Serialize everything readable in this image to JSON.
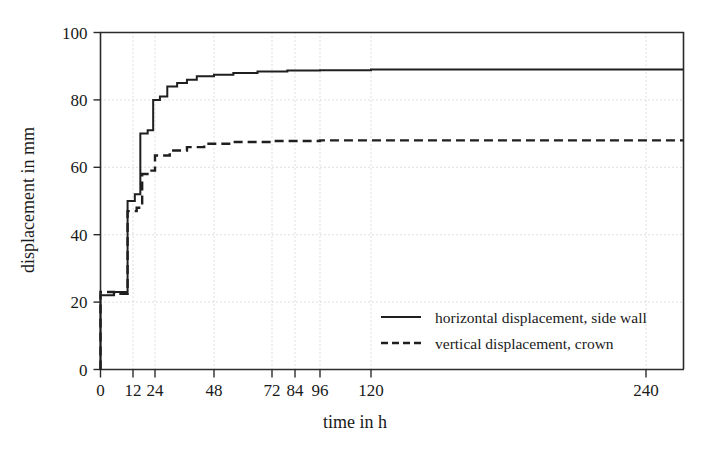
{
  "chart_data": {
    "type": "line",
    "title": "",
    "xlabel": "time in h",
    "ylabel": "displacement in mm",
    "xlim": [
      0,
      252
    ],
    "ylim": [
      0,
      100
    ],
    "grid": true,
    "legend_position": "inside-lower-right",
    "xticks": [
      0,
      12,
      24,
      48,
      72,
      84,
      96,
      120,
      240
    ],
    "xtick_labels": [
      "0",
      "12",
      "24",
      "48",
      "72",
      "84",
      "96",
      "120",
      "240"
    ],
    "yticks": [
      0,
      20,
      40,
      60,
      80,
      100
    ],
    "ytick_labels": [
      "0",
      "20",
      "40",
      "60",
      "80",
      "100"
    ],
    "series": [
      {
        "name": "horizontal displacement, side wall",
        "style": "solid",
        "points": [
          [
            0,
            0
          ],
          [
            0,
            22
          ],
          [
            5,
            22
          ],
          [
            5,
            23
          ],
          [
            10,
            23
          ],
          [
            10,
            50
          ],
          [
            13,
            50
          ],
          [
            13,
            52
          ],
          [
            16,
            52
          ],
          [
            16,
            70
          ],
          [
            20,
            70
          ],
          [
            20,
            71
          ],
          [
            23,
            71
          ],
          [
            23,
            80
          ],
          [
            26,
            80
          ],
          [
            26,
            81
          ],
          [
            29,
            81
          ],
          [
            29,
            84
          ],
          [
            33,
            84
          ],
          [
            33,
            85
          ],
          [
            37,
            85
          ],
          [
            37,
            86
          ],
          [
            41,
            86
          ],
          [
            41,
            87
          ],
          [
            48,
            87
          ],
          [
            48,
            87.5
          ],
          [
            56,
            87.5
          ],
          [
            56,
            88
          ],
          [
            66,
            88
          ],
          [
            66,
            88.4
          ],
          [
            80,
            88.4
          ],
          [
            80,
            88.7
          ],
          [
            96,
            88.7
          ],
          [
            96,
            88.8
          ],
          [
            120,
            88.8
          ],
          [
            120,
            89
          ],
          [
            240,
            89
          ],
          [
            252,
            89
          ]
        ]
      },
      {
        "name": "vertical displacement, crown",
        "style": "dashed",
        "points": [
          [
            0,
            0
          ],
          [
            0,
            23
          ],
          [
            5,
            23
          ],
          [
            5,
            22.5
          ],
          [
            10,
            22.5
          ],
          [
            10,
            47
          ],
          [
            14,
            47
          ],
          [
            14,
            48
          ],
          [
            17,
            48
          ],
          [
            17,
            58
          ],
          [
            21,
            58
          ],
          [
            21,
            59
          ],
          [
            24,
            59
          ],
          [
            24,
            63.5
          ],
          [
            30,
            63.5
          ],
          [
            30,
            65
          ],
          [
            37,
            65
          ],
          [
            37,
            66
          ],
          [
            44,
            66
          ],
          [
            44,
            67
          ],
          [
            56,
            67
          ],
          [
            56,
            67.5
          ],
          [
            72,
            67.5
          ],
          [
            72,
            67.8
          ],
          [
            96,
            67.8
          ],
          [
            96,
            68
          ],
          [
            240,
            68
          ],
          [
            252,
            68
          ]
        ]
      }
    ],
    "legend_entries": [
      {
        "label": "horizontal displacement, side wall",
        "style": "solid"
      },
      {
        "label": "vertical displacement, crown",
        "style": "dashed"
      }
    ],
    "colors": {
      "series": "#1f1f1f",
      "axis": "#2b2b2b",
      "grid": "#b9b9b9",
      "background": "#ffffff"
    }
  }
}
